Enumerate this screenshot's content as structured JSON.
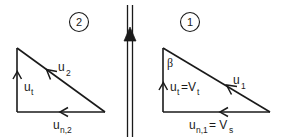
{
  "diagram": {
    "background_color": "#ffffff",
    "line_color": "#1a1a1a",
    "badges": {
      "left": "2",
      "right": "1"
    },
    "center_axis": {
      "icon": "up-arrow-double-shaft",
      "description": "vertical double line with upward filled arrowhead"
    },
    "left_triangle": {
      "name": "velocity-triangle-2",
      "hypotenuse_label": "u",
      "hypotenuse_sub": "2",
      "vertical_label": "u",
      "vertical_sub": "t",
      "base_label": "u",
      "base_sub": "n,2"
    },
    "right_triangle": {
      "name": "velocity-triangle-1",
      "angle_label": "β",
      "hypotenuse_label": "u",
      "hypotenuse_sub": "1",
      "vertical_label": "u",
      "vertical_sub": "t",
      "vertical_equals": "=V",
      "vertical_equals_sub": "t",
      "base_label": "u",
      "base_sub": "n,1",
      "base_equals": "= V",
      "base_equals_sub": "s"
    }
  }
}
